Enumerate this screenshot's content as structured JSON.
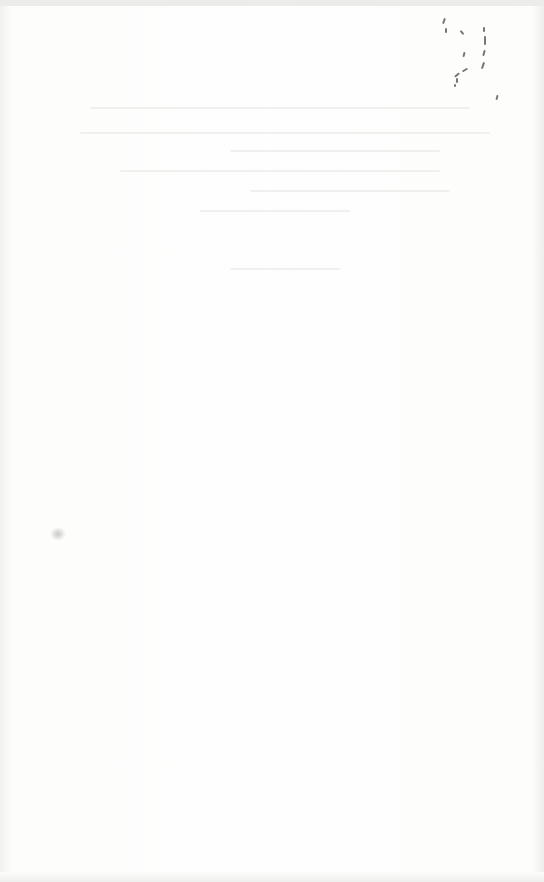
{
  "document": {
    "type": "blank scanned page",
    "visible_text": ""
  }
}
